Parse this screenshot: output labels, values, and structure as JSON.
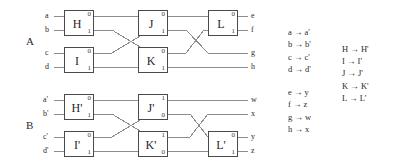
{
  "figure": {
    "type": "circuit-equivalence-diagram",
    "panels": [
      {
        "id": "A",
        "label": "A",
        "inputs": [
          "a",
          "b",
          "c",
          "d"
        ],
        "outputs": [
          "e",
          "f",
          "g",
          "h"
        ],
        "gates": [
          {
            "name": "H",
            "port_top": "0",
            "port_bottom": "1",
            "column": 1,
            "row": "upper"
          },
          {
            "name": "I",
            "port_top": "0",
            "port_bottom": "1",
            "column": 1,
            "row": "lower"
          },
          {
            "name": "J",
            "port_top": "0",
            "port_bottom": "1",
            "column": 2,
            "row": "upper"
          },
          {
            "name": "K",
            "port_top": "0",
            "port_bottom": "1",
            "column": 2,
            "row": "lower"
          },
          {
            "name": "L",
            "port_top": "0",
            "port_bottom": "1",
            "column": 3,
            "row": "upper"
          }
        ]
      },
      {
        "id": "B",
        "label": "B",
        "inputs": [
          "a'",
          "b'",
          "c'",
          "d'"
        ],
        "outputs": [
          "w",
          "x",
          "y",
          "z"
        ],
        "gates": [
          {
            "name": "H'",
            "port_top": "0",
            "port_bottom": "1",
            "column": 1,
            "row": "upper"
          },
          {
            "name": "I'",
            "port_top": "0",
            "port_bottom": "1",
            "column": 1,
            "row": "lower"
          },
          {
            "name": "J'",
            "port_top": "1",
            "port_bottom": "0",
            "column": 2,
            "row": "upper"
          },
          {
            "name": "K'",
            "port_top": "1",
            "port_bottom": "0",
            "column": 2,
            "row": "lower"
          },
          {
            "name": "L'",
            "port_top": "0",
            "port_bottom": "1",
            "column": 3,
            "row": "lower"
          }
        ]
      }
    ]
  },
  "mappings": {
    "arrow": "→",
    "input_map": [
      {
        "from": "a",
        "to": "a'"
      },
      {
        "from": "b",
        "to": "b'"
      },
      {
        "from": "c",
        "to": "c'"
      },
      {
        "from": "d",
        "to": "d'"
      }
    ],
    "output_map": [
      {
        "from": "e",
        "to": "y"
      },
      {
        "from": "f",
        "to": "z"
      },
      {
        "from": "g",
        "to": "w"
      },
      {
        "from": "h",
        "to": "x"
      }
    ],
    "gate_map": [
      {
        "from": "H",
        "to": "H'"
      },
      {
        "from": "I",
        "to": "I'"
      },
      {
        "from": "J",
        "to": "J'"
      },
      {
        "from": "K",
        "to": "K'"
      },
      {
        "from": "L",
        "to": "L'"
      }
    ]
  },
  "colors": {
    "background": "#ffffff",
    "wire": "#8c8c8c",
    "gate_border": "#4a4a4a",
    "text": "#2b2b2b"
  }
}
